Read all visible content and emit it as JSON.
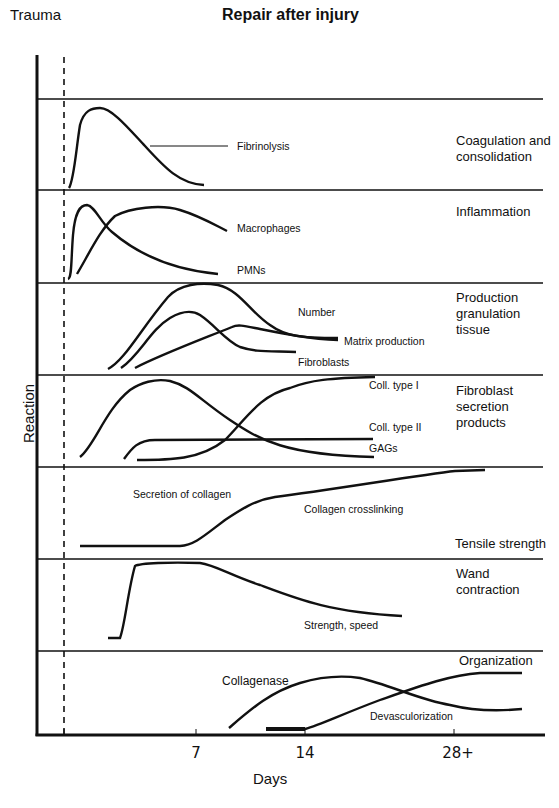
{
  "header": {
    "title": "Repair after injury",
    "trauma_label": "Trauma"
  },
  "axes": {
    "y_label": "Reaction",
    "x_label": "Days",
    "x_ticks": [
      "7",
      "14",
      "28+"
    ]
  },
  "panels": [
    {
      "title": "Coagulation and consolidation",
      "title_lines": [
        "Coagulation and",
        "consolidation"
      ],
      "curves": [
        {
          "label": "Fibrinolysis"
        }
      ]
    },
    {
      "title": "Inflammation",
      "title_lines": [
        "Inflammation"
      ],
      "curves": [
        {
          "label": "Macrophages"
        },
        {
          "label": "PMNs"
        }
      ]
    },
    {
      "title": "Production granulation tissue",
      "title_lines": [
        "Production",
        "granulation",
        "tissue"
      ],
      "curves": [
        {
          "label": "Number"
        },
        {
          "label": "Matrix production"
        },
        {
          "label": "Fibroblasts"
        }
      ]
    },
    {
      "title": "Fibroblast secretion products",
      "title_lines": [
        "Fibroblast",
        "secretion",
        "products"
      ],
      "curves": [
        {
          "label": "Coll. type I"
        },
        {
          "label": "Coll. type II"
        },
        {
          "label": "GAGs"
        }
      ]
    },
    {
      "title": "Tensile strength",
      "title_lines": [
        "Tensile strength"
      ],
      "curves": [
        {
          "label": "Secretion of collagen"
        },
        {
          "label": "Collagen crosslinking"
        }
      ]
    },
    {
      "title": "Wand contraction",
      "title_lines": [
        "Wand",
        "contraction"
      ],
      "curves": [
        {
          "label": "Strength, speed"
        }
      ]
    },
    {
      "title": "Organization",
      "title_lines": [
        "Organization"
      ],
      "curves": [
        {
          "label": "Collagenase"
        },
        {
          "label": "Devasculorization"
        }
      ]
    }
  ],
  "colors": {
    "line": "#111111",
    "background": "#ffffff"
  }
}
